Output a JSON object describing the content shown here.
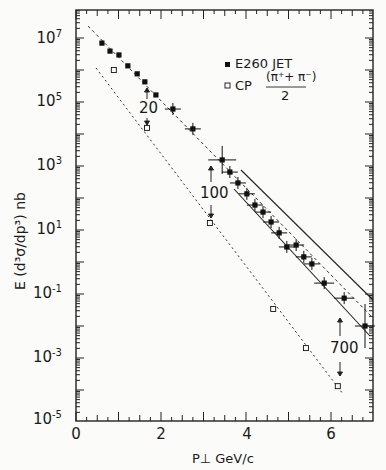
{
  "chart_data": {
    "type": "scatter",
    "title": "",
    "xlabel": "P⊥  GeV/c",
    "ylabel": "E (d³σ/dp³) nb",
    "xlim": [
      0,
      7
    ],
    "ylim_log10": [
      -5,
      7.9
    ],
    "yscale": "log",
    "grid": false,
    "x_ticks": [
      "0",
      "2",
      "4",
      "6"
    ],
    "y_ticks": [
      "10^7",
      "10^5",
      "10^3",
      "10^1",
      "10^-1",
      "10^-3",
      "10^-5"
    ],
    "legend": {
      "position": "upper right",
      "entries": [
        "E260 JET",
        "CP (π⁺+π⁻)/2"
      ]
    },
    "series": [
      {
        "name": "E260 JET",
        "marker": "filled-square",
        "x": [
          0.61,
          0.8,
          1.01,
          1.22,
          1.44,
          1.62,
          1.88,
          2.28,
          2.75,
          3.44,
          3.62,
          3.81,
          4.02,
          4.21,
          4.4,
          4.59,
          4.78,
          4.96,
          5.18,
          5.36,
          5.55,
          5.84,
          6.31,
          6.8
        ],
        "log10_y": [
          6.84,
          6.59,
          6.47,
          6.13,
          5.88,
          5.63,
          5.22,
          4.78,
          4.16,
          3.19,
          2.81,
          2.47,
          2.13,
          1.78,
          1.56,
          1.25,
          0.91,
          0.47,
          0.53,
          0.16,
          -0.06,
          -0.66,
          -1.13,
          -2.0
        ]
      },
      {
        "name": "CP (π⁺+π⁻)/2",
        "marker": "open-square",
        "x": [
          0.89,
          1.67,
          3.15,
          4.64,
          5.41,
          6.16
        ],
        "log10_y": [
          6.0,
          4.19,
          1.22,
          -1.47,
          -2.69,
          -3.88
        ]
      }
    ],
    "annotations": [
      {
        "text": "20",
        "x": 1.7,
        "note": "ratio arrows between curves"
      },
      {
        "text": "100",
        "x": 3.2
      },
      {
        "text": "700",
        "x": 6.2
      }
    ],
    "bands": "two solid lines bracketing the JET data at high P⊥ (3.7–7 GeV/c)"
  },
  "labels": {
    "y_ticks": [
      {
        "base": "10",
        "exp": "7"
      },
      {
        "base": "10",
        "exp": "5"
      },
      {
        "base": "10",
        "exp": "3"
      },
      {
        "base": "10",
        "exp": "1"
      },
      {
        "base": "10",
        "exp": "-1"
      },
      {
        "base": "10",
        "exp": "-3"
      },
      {
        "base": "10",
        "exp": "-5"
      }
    ],
    "x_ticks": [
      "0",
      "2",
      "4",
      "6"
    ],
    "xlabel": "P⊥   GeV/c",
    "ylabel": "E  (d³σ/dp³)  nb",
    "legend_jet": "E260 JET",
    "legend_cp_prefix": "CP",
    "legend_cp_num": "(π⁺+ π⁻)",
    "legend_cp_den": "2",
    "ann_20": "20",
    "ann_100": "100",
    "ann_700": "700"
  }
}
